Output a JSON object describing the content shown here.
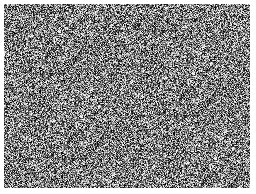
{
  "image": {
    "description": "grayscale random noise field",
    "background_color": "#ffffff",
    "noise_mean_color": "#7a7a7a",
    "noise_region": {
      "x": 4,
      "y": 4,
      "width": 246,
      "height": 184
    }
  }
}
